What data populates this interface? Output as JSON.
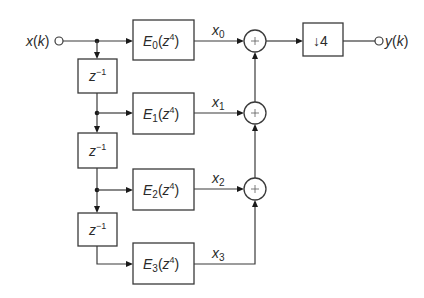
{
  "diagram": {
    "type": "polyphase decimator block diagram",
    "input": {
      "label": "x(k)",
      "var": "x",
      "arg": "k"
    },
    "output": {
      "label": "y(k)",
      "var": "y",
      "arg": "k"
    },
    "delays": [
      {
        "label": "z−1",
        "base": "z",
        "exp": "−1"
      },
      {
        "label": "z−1",
        "base": "z",
        "exp": "−1"
      },
      {
        "label": "z−1",
        "base": "z",
        "exp": "−1"
      }
    ],
    "branches": [
      {
        "filter": "E0(z4)",
        "fname": "E",
        "fsub": "0",
        "zexp": "4",
        "signal": "x0",
        "sig_var": "x",
        "sig_sub": "0"
      },
      {
        "filter": "E1(z4)",
        "fname": "E",
        "fsub": "1",
        "zexp": "4",
        "signal": "x1",
        "sig_var": "x",
        "sig_sub": "1"
      },
      {
        "filter": "E2(z4)",
        "fname": "E",
        "fsub": "2",
        "zexp": "4",
        "signal": "x2",
        "sig_var": "x",
        "sig_sub": "2"
      },
      {
        "filter": "E3(z4)",
        "fname": "E",
        "fsub": "3",
        "zexp": "4",
        "signal": "x3",
        "sig_var": "x",
        "sig_sub": "3"
      }
    ],
    "summers": [
      {
        "symbol": "+"
      },
      {
        "symbol": "+"
      },
      {
        "symbol": "+"
      }
    ],
    "downsampler": {
      "label": "↓4",
      "arrow": "↓",
      "factor": "4"
    }
  }
}
